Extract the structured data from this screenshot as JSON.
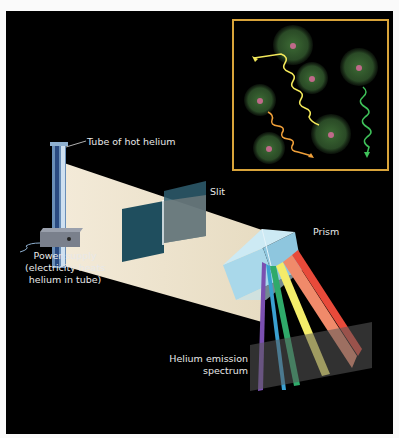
{
  "diagram": {
    "labels": {
      "tube": "Tube of hot helium",
      "power_line1": "Power supply",
      "power_line2": "(electricity heats",
      "power_line3": "helium in tube)",
      "slit": "Slit",
      "prism": "Prism",
      "spectrum_line1": "Helium emission",
      "spectrum_line2": "spectrum"
    },
    "inset": {
      "description": "Excited helium atoms emitting photons",
      "border_color": "#d9a43a",
      "photon_colors": [
        "#f2e85a",
        "#f0a03a",
        "#3fc25a"
      ]
    },
    "spectrum_colors": [
      "#7a4fb0",
      "#3aa0d0",
      "#2faa6a",
      "#f4ec6a",
      "#f08a6a",
      "#e84a3a"
    ]
  }
}
